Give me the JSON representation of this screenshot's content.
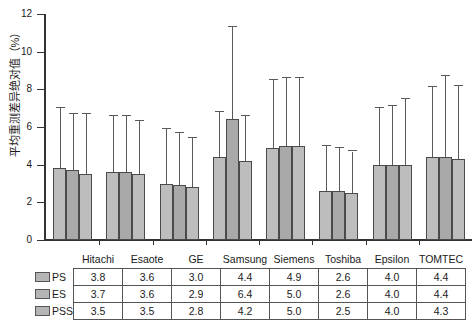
{
  "chart_data": {
    "type": "bar",
    "title": "",
    "xlabel": "",
    "ylabel": "平均重测差异绝对值（%）",
    "ylim": [
      0,
      12
    ],
    "yticks": [
      0,
      2,
      4,
      6,
      8,
      10,
      12
    ],
    "grid": false,
    "legend_position": "table-left",
    "categories": [
      "Hitachi",
      "Esaote",
      "GE",
      "Samsung",
      "Siemens",
      "Toshiba",
      "Epsilon",
      "TOMTEC"
    ],
    "series": [
      {
        "name": "PS",
        "values": [
          3.8,
          3.6,
          3.0,
          4.4,
          4.9,
          2.6,
          4.0,
          4.4
        ],
        "error_high": [
          7.0,
          6.6,
          5.9,
          6.8,
          8.5,
          5.0,
          7.0,
          8.1
        ],
        "color": "#bdbdbd"
      },
      {
        "name": "ES",
        "values": [
          3.7,
          3.6,
          2.9,
          6.4,
          5.0,
          2.6,
          4.0,
          4.4
        ],
        "error_high": [
          6.7,
          6.6,
          5.7,
          11.3,
          8.6,
          4.9,
          7.1,
          8.7
        ],
        "color": "#a9a9a9"
      },
      {
        "name": "PSS",
        "values": [
          3.5,
          3.5,
          2.8,
          4.2,
          5.0,
          2.5,
          4.0,
          4.3
        ],
        "error_high": [
          6.7,
          6.3,
          5.4,
          6.6,
          8.6,
          4.7,
          7.5,
          8.2
        ],
        "color": "#bdbdbd"
      }
    ]
  },
  "table": {
    "column_headers": [
      "Hitachi",
      "Esaote",
      "GE",
      "Samsung",
      "Siemens",
      "Toshiba",
      "Epsilon",
      "TOMTEC"
    ],
    "rows": [
      {
        "label": "PS",
        "values": [
          "3.8",
          "3.6",
          "3.0",
          "4.4",
          "4.9",
          "2.6",
          "4.0",
          "4.4"
        ]
      },
      {
        "label": "ES",
        "values": [
          "3.7",
          "3.6",
          "2.9",
          "6.4",
          "5.0",
          "2.6",
          "4.0",
          "4.4"
        ]
      },
      {
        "label": "PSS",
        "values": [
          "3.5",
          "3.5",
          "2.8",
          "4.2",
          "5.0",
          "2.5",
          "4.0",
          "4.3"
        ]
      }
    ]
  },
  "colors": {
    "series_light": "#bdbdbd",
    "series_dark": "#a9a9a9",
    "bar_border": "#4a4a4a",
    "axis": "#333333",
    "error_bar": "#5a5a5a"
  }
}
